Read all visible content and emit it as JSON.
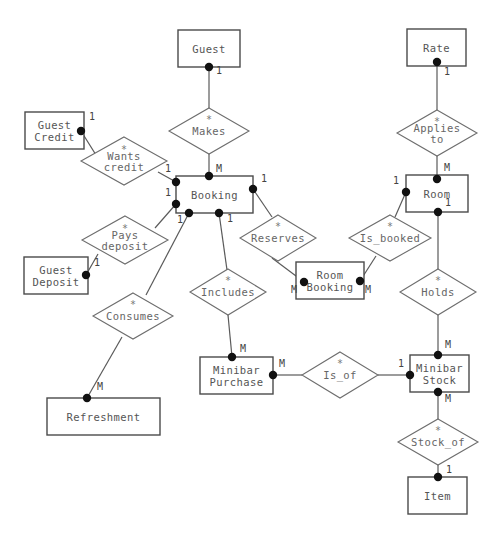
{
  "diagram": {
    "type": "entity-relationship-diagram",
    "notation": "chen-with-crows-dots",
    "canvas": {
      "width": 502,
      "height": 537,
      "background": "#ffffff"
    },
    "styles": {
      "entity_stroke": "#4a4a4a",
      "relationship_stroke": "#6e6e6e",
      "edge_stroke": "#5a5a5a",
      "dot_fill": "#111111",
      "text_fill": "#555555"
    }
  },
  "entities": [
    {
      "id": "guest",
      "label": "Guest",
      "lines": [
        "Guest"
      ],
      "x": 178,
      "y": 30,
      "w": 62,
      "h": 37
    },
    {
      "id": "rate",
      "label": "Rate",
      "lines": [
        "Rate"
      ],
      "x": 407,
      "y": 29,
      "w": 59,
      "h": 37
    },
    {
      "id": "guest_credit",
      "label": "Guest Credit",
      "lines": [
        "Guest",
        "Credit"
      ],
      "x": 25,
      "y": 112,
      "w": 59,
      "h": 37
    },
    {
      "id": "booking",
      "label": "Booking",
      "lines": [
        "Booking"
      ],
      "x": 176,
      "y": 176,
      "w": 77,
      "h": 37
    },
    {
      "id": "room",
      "label": "Room",
      "lines": [
        "Room"
      ],
      "x": 406,
      "y": 175,
      "w": 62,
      "h": 37
    },
    {
      "id": "guest_deposit",
      "label": "Guest Deposit",
      "lines": [
        "Guest",
        "Deposit"
      ],
      "x": 24,
      "y": 257,
      "w": 64,
      "h": 37
    },
    {
      "id": "room_booking",
      "label": "Room Booking",
      "lines": [
        "Room",
        "Booking"
      ],
      "x": 296,
      "y": 262,
      "w": 68,
      "h": 37
    },
    {
      "id": "minibar_purchase",
      "label": "Minibar Purchase",
      "lines": [
        "Minibar",
        "Purchase"
      ],
      "x": 200,
      "y": 357,
      "w": 73,
      "h": 37
    },
    {
      "id": "minibar_stock",
      "label": "Minibar Stock",
      "lines": [
        "Minibar",
        "Stock"
      ],
      "x": 410,
      "y": 355,
      "w": 59,
      "h": 37
    },
    {
      "id": "refreshment",
      "label": "Refreshment",
      "lines": [
        "Refreshment"
      ],
      "x": 47,
      "y": 398,
      "w": 113,
      "h": 37
    },
    {
      "id": "item",
      "label": "Item",
      "lines": [
        "Item"
      ],
      "x": 408,
      "y": 477,
      "w": 59,
      "h": 37
    }
  ],
  "relationships": [
    {
      "id": "makes",
      "label": "Makes",
      "lines": [
        "Makes"
      ],
      "star": "*",
      "cx": 209,
      "cy": 131,
      "rx": 40,
      "ry": 23
    },
    {
      "id": "applies_to",
      "label": "Applies to",
      "lines": [
        "Applies",
        "to"
      ],
      "star": "*",
      "cx": 437,
      "cy": 133,
      "rx": 40,
      "ry": 23
    },
    {
      "id": "wants_credit",
      "label": "Wants credit",
      "lines": [
        "Wants",
        "credit"
      ],
      "star": "*",
      "cx": 124,
      "cy": 161,
      "rx": 43,
      "ry": 24
    },
    {
      "id": "pays_deposit",
      "label": "Pays deposit",
      "lines": [
        "Pays",
        "deposit"
      ],
      "star": "*",
      "cx": 125,
      "cy": 240,
      "rx": 43,
      "ry": 24
    },
    {
      "id": "reserves",
      "label": "Reserves",
      "lines": [
        "Reserves"
      ],
      "star": "*",
      "cx": 278,
      "cy": 238,
      "rx": 38,
      "ry": 23
    },
    {
      "id": "is_booked",
      "label": "Is_booked",
      "lines": [
        "Is_booked"
      ],
      "star": "*",
      "cx": 390,
      "cy": 238,
      "rx": 41,
      "ry": 23
    },
    {
      "id": "includes",
      "label": "Includes",
      "lines": [
        "Includes"
      ],
      "star": "*",
      "cx": 228,
      "cy": 292,
      "rx": 38,
      "ry": 23
    },
    {
      "id": "holds",
      "label": "Holds",
      "lines": [
        "Holds"
      ],
      "star": "*",
      "cx": 438,
      "cy": 292,
      "rx": 38,
      "ry": 23
    },
    {
      "id": "consumes",
      "label": "Consumes",
      "lines": [
        "Consumes"
      ],
      "star": "*",
      "cx": 133,
      "cy": 316,
      "rx": 40,
      "ry": 23
    },
    {
      "id": "is_of",
      "label": "Is_of",
      "lines": [
        "Is_of"
      ],
      "star": "*",
      "cx": 340,
      "cy": 375,
      "rx": 38,
      "ry": 23
    },
    {
      "id": "stock_of",
      "label": "Stock_of",
      "lines": [
        "Stock_of"
      ],
      "star": "*",
      "cx": 438,
      "cy": 442,
      "rx": 40,
      "ry": 23
    }
  ],
  "connections": [
    {
      "id": "guest-makes",
      "from": "guest",
      "to": "makes",
      "x1": 209,
      "y1": 67,
      "x2": 209,
      "y2": 108,
      "dot_x": 209,
      "dot_y": 67,
      "card": "1",
      "card_x": 219,
      "card_y": 74
    },
    {
      "id": "makes-booking",
      "from": "makes",
      "to": "booking",
      "x1": 209,
      "y1": 154,
      "x2": 209,
      "y2": 176,
      "dot_x": 209,
      "dot_y": 176,
      "card": "M",
      "card_x": 219,
      "card_y": 172
    },
    {
      "id": "rate-applies_to",
      "from": "rate",
      "to": "applies_to",
      "x1": 437,
      "y1": 66,
      "x2": 437,
      "y2": 110,
      "dot_x": 437,
      "dot_y": 62,
      "card": "1",
      "card_x": 447,
      "card_y": 75
    },
    {
      "id": "applies_to-room",
      "from": "applies_to",
      "to": "room",
      "x1": 437,
      "y1": 156,
      "x2": 437,
      "y2": 175,
      "dot_x": 437,
      "dot_y": 179,
      "card": "M",
      "card_x": 447,
      "card_y": 171
    },
    {
      "id": "guest_credit-wants",
      "from": "guest_credit",
      "to": "wants_credit",
      "x1": 81,
      "y1": 131,
      "x2": 96,
      "y2": 155,
      "dot_x": 81,
      "dot_y": 131,
      "card": "1",
      "card_x": 92,
      "card_y": 120
    },
    {
      "id": "wants-booking",
      "from": "wants_credit",
      "to": "booking",
      "x1": 158,
      "y1": 172,
      "x2": 176,
      "y2": 182,
      "dot_x": 176,
      "dot_y": 182,
      "card": "1",
      "card_x": 168,
      "card_y": 172
    },
    {
      "id": "guest_deposit-pays",
      "from": "guest_deposit",
      "to": "pays_deposit",
      "x1": 86,
      "y1": 275,
      "x2": 98,
      "y2": 254,
      "dot_x": 86,
      "dot_y": 275,
      "card": "1",
      "card_x": 97,
      "card_y": 266
    },
    {
      "id": "pays-booking",
      "from": "pays_deposit",
      "to": "booking",
      "x1": 155,
      "y1": 228,
      "x2": 176,
      "y2": 204,
      "dot_x": 176,
      "dot_y": 204,
      "card": "1",
      "card_x": 168,
      "card_y": 196
    },
    {
      "id": "booking-reserves",
      "from": "booking",
      "to": "reserves",
      "x1": 253,
      "y1": 189,
      "x2": 272,
      "y2": 217,
      "dot_x": 253,
      "dot_y": 189,
      "card": "1",
      "card_x": 264,
      "card_y": 182
    },
    {
      "id": "reserves-room_booking",
      "from": "reserves",
      "to": "room_booking",
      "x1": 272,
      "y1": 258,
      "x2": 304,
      "y2": 282,
      "dot_x": 304,
      "dot_y": 282,
      "card": "M",
      "card_x": 294,
      "card_y": 293
    },
    {
      "id": "room-is_booked",
      "from": "room",
      "to": "is_booked",
      "x1": 406,
      "y1": 192,
      "x2": 395,
      "y2": 217,
      "dot_x": 406,
      "dot_y": 192,
      "card": "1",
      "card_x": 396,
      "card_y": 184
    },
    {
      "id": "is_booked-room_booking",
      "from": "is_booked",
      "to": "room_booking",
      "x1": 376,
      "y1": 256,
      "x2": 360,
      "y2": 281,
      "dot_x": 360,
      "dot_y": 281,
      "card": "M",
      "card_x": 368,
      "card_y": 293
    },
    {
      "id": "booking-includes",
      "from": "booking",
      "to": "includes",
      "x1": 219,
      "y1": 213,
      "x2": 227,
      "y2": 270,
      "dot_x": 219,
      "dot_y": 213,
      "card": "1",
      "card_x": 230,
      "card_y": 222
    },
    {
      "id": "includes-minibar_purchase",
      "from": "includes",
      "to": "minibar_purchase",
      "x1": 228,
      "y1": 315,
      "x2": 232,
      "y2": 357,
      "dot_x": 232,
      "dot_y": 357,
      "card": "M",
      "card_x": 243,
      "card_y": 352
    },
    {
      "id": "booking-consumes",
      "from": "booking",
      "to": "consumes",
      "x1": 189,
      "y1": 213,
      "x2": 146,
      "y2": 295,
      "dot_x": 189,
      "dot_y": 213,
      "card": "1",
      "card_x": 180,
      "card_y": 223
    },
    {
      "id": "consumes-refreshment",
      "from": "consumes",
      "to": "refreshment",
      "x1": 122,
      "y1": 337,
      "x2": 87,
      "y2": 398,
      "dot_x": 87,
      "dot_y": 398,
      "card": "M",
      "card_x": 100,
      "card_y": 390
    },
    {
      "id": "room-holds",
      "from": "room",
      "to": "holds",
      "x1": 438,
      "y1": 212,
      "x2": 438,
      "y2": 270,
      "dot_x": 438,
      "dot_y": 212,
      "card": "1",
      "card_x": 448,
      "card_y": 206
    },
    {
      "id": "holds-minibar_stock",
      "from": "holds",
      "to": "minibar_stock",
      "x1": 438,
      "y1": 315,
      "x2": 438,
      "y2": 355,
      "dot_x": 438,
      "dot_y": 355,
      "card": "M",
      "card_x": 448,
      "card_y": 348
    },
    {
      "id": "minibar_purchase-is_of",
      "from": "minibar_purchase",
      "to": "is_of",
      "x1": 273,
      "y1": 375,
      "x2": 302,
      "y2": 375,
      "dot_x": 273,
      "dot_y": 375,
      "card": "M",
      "card_x": 282,
      "card_y": 367
    },
    {
      "id": "is_of-minibar_stock",
      "from": "is_of",
      "to": "minibar_stock",
      "x1": 378,
      "y1": 375,
      "x2": 410,
      "y2": 375,
      "dot_x": 410,
      "dot_y": 375,
      "card": "1",
      "card_x": 401,
      "card_y": 367
    },
    {
      "id": "minibar_stock-stock_of",
      "from": "minibar_stock",
      "to": "stock_of",
      "x1": 438,
      "y1": 392,
      "x2": 438,
      "y2": 420,
      "dot_x": 438,
      "dot_y": 392,
      "card": "M",
      "card_x": 448,
      "card_y": 402
    },
    {
      "id": "stock_of-item",
      "from": "stock_of",
      "to": "item",
      "x1": 438,
      "y1": 464,
      "x2": 438,
      "y2": 477,
      "dot_x": 438,
      "dot_y": 477,
      "card": "1",
      "card_x": 449,
      "card_y": 473
    }
  ]
}
